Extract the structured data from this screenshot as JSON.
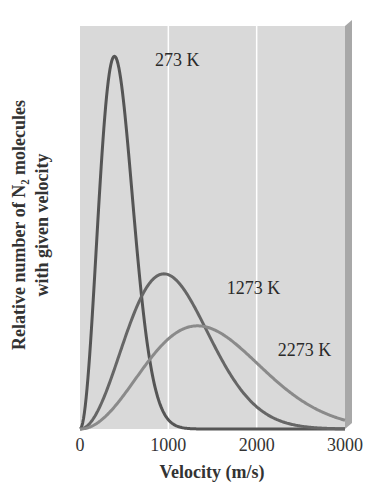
{
  "chart_data": {
    "type": "line",
    "title": "",
    "xlabel": "Velocity (m/s)",
    "ylabel_lines": [
      "Relative number of N₂ molecules",
      "with given velocity"
    ],
    "xlim": [
      0,
      3000
    ],
    "ylim": [
      0,
      1
    ],
    "x_ticks": [
      "0",
      "1000",
      "2000",
      "3000"
    ],
    "x_tick_values": [
      0,
      1000,
      2000,
      3000
    ],
    "grid": {
      "vertical": [
        1000,
        2000
      ],
      "horizontal": false
    },
    "background": "#d9d9d9",
    "series": [
      {
        "name": "273 K",
        "peak_velocity": 390,
        "peak_relative_height": 0.925,
        "color": "#555555",
        "label_pos": [
          850,
          0.9
        ]
      },
      {
        "name": "1273 K",
        "peak_velocity": 950,
        "peak_relative_height": 0.385,
        "color": "#666666",
        "label_pos": [
          1660,
          0.335
        ]
      },
      {
        "name": "2273 K",
        "peak_velocity": 1330,
        "peak_relative_height": 0.256,
        "color": "#8a8a8a",
        "label_pos": [
          2240,
          0.18
        ]
      }
    ]
  }
}
